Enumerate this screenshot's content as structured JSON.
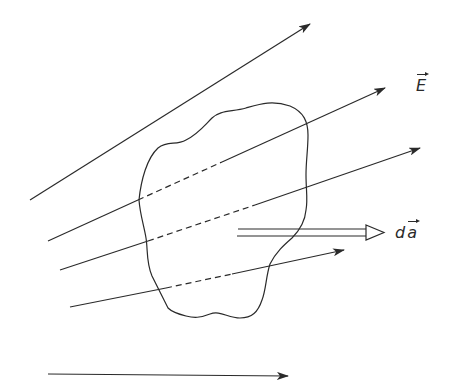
{
  "figure": {
    "type": "electric flux diagram",
    "labels": {
      "field": "E",
      "area_element_prefix": "d",
      "area_element_vector": "a"
    },
    "colors": {
      "stroke": "#2a2a2a",
      "background": "#ffffff"
    },
    "field_lines": [
      {
        "id": "line-1",
        "from": [
          30,
          200
        ],
        "to": [
          310,
          24
        ],
        "crosses_surface": false
      },
      {
        "id": "line-2",
        "from": [
          48,
          241
        ],
        "to": [
          385,
          88
        ],
        "crosses_surface": true,
        "dashed_segment": [
          [
            138,
            200
          ],
          [
            220,
            163
          ]
        ]
      },
      {
        "id": "line-3",
        "from": [
          60,
          270
        ],
        "to": [
          420,
          148
        ],
        "crosses_surface": true,
        "dashed_segment": [
          [
            148,
            241
          ],
          [
            255,
            205
          ]
        ]
      },
      {
        "id": "line-4",
        "from": [
          70,
          307
        ],
        "to": [
          344,
          250
        ],
        "crosses_surface": true,
        "dashed_segment": [
          [
            166,
            288
          ],
          [
            230,
            275
          ]
        ]
      },
      {
        "id": "reference-arrow",
        "from": [
          48,
          374
        ],
        "to": [
          288,
          376
        ],
        "crosses_surface": false
      }
    ],
    "area_vector": {
      "from": [
        237,
        232
      ],
      "to": [
        384,
        232
      ],
      "style": "double-line hollow arrow"
    }
  }
}
